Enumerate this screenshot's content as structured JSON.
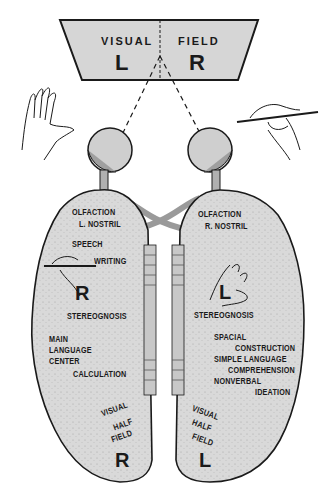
{
  "visual_field": {
    "left_word": "VISUAL",
    "right_word": "FIELD",
    "left_letter": "L",
    "right_letter": "R"
  },
  "left_hemisphere": {
    "olfaction": "OLFACTION",
    "nostril": "L. NOSTRIL",
    "speech": "SPEECH",
    "writing": "WRITING",
    "hand_letter": "R",
    "stereognosis": "STEREOGNOSIS",
    "main": "MAIN",
    "language": "LANGUAGE",
    "center": "CENTER",
    "calculation": "CALCULATION",
    "visual": "VISUAL",
    "half": "HALF",
    "field": "FIELD",
    "field_letter": "R"
  },
  "right_hemisphere": {
    "olfaction": "OLFACTION",
    "nostril": "R. NOSTRIL",
    "hand_letter": "L",
    "stereognosis": "STEREOGNOSIS",
    "spacial": "SPACIAL",
    "construction": "CONSTRUCTION",
    "simple_language": "SIMPLE LANGUAGE",
    "comprehension": "COMPREHENSION",
    "nonverbal": "NONVERBAL",
    "ideation": "IDEATION",
    "visual": "VISUAL",
    "half": "HALF",
    "field": "FIELD",
    "field_letter": "L"
  },
  "icons": {
    "left_hand": "open-hand-icon",
    "right_hand": "hand-with-pen-icon"
  },
  "colors": {
    "panel_fill": "#d6d6d6",
    "hemisphere_fill": "#d9d9d9",
    "eye_fill": "#cfcfcf",
    "ink": "#1a1a1a"
  }
}
